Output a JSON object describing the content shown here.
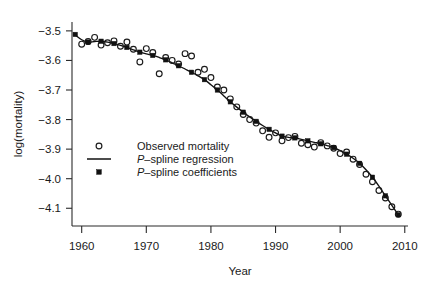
{
  "chart_data": {
    "type": "scatter",
    "title": "",
    "xlabel": "Year",
    "ylabel": "log(mortality)",
    "xlim": [
      1958.5,
      2010.5
    ],
    "ylim": [
      -4.16,
      -3.47
    ],
    "grid": false,
    "legend_position": "left-center",
    "x_ticks": [
      1960,
      1970,
      1980,
      1990,
      2000,
      2010
    ],
    "x_tick_labels": [
      "1960",
      "1970",
      "1980",
      "1990",
      "2000",
      "2010"
    ],
    "y_ticks": [
      -3.5,
      -3.6,
      -3.7,
      -3.8,
      -3.9,
      -4.0,
      -4.1
    ],
    "y_tick_labels": [
      "-3.5",
      "-3.6",
      "-3.7",
      "-3.8",
      "-3.9",
      "-4.0",
      "-4.1"
    ],
    "series": [
      {
        "name": "Observed mortality",
        "marker": "open-circle",
        "x": [
          1960,
          1961,
          1962,
          1963,
          1964,
          1965,
          1966,
          1967,
          1968,
          1969,
          1970,
          1971,
          1972,
          1973,
          1974,
          1975,
          1976,
          1977,
          1978,
          1979,
          1980,
          1981,
          1982,
          1983,
          1984,
          1985,
          1986,
          1987,
          1988,
          1989,
          1990,
          1991,
          1992,
          1993,
          1994,
          1995,
          1996,
          1997,
          1998,
          1999,
          2000,
          2001,
          2002,
          2003,
          2004,
          2005,
          2006,
          2007,
          2008,
          2009
        ],
        "y": [
          -3.545,
          -3.536,
          -3.522,
          -3.548,
          -3.54,
          -3.534,
          -3.552,
          -3.538,
          -3.562,
          -3.605,
          -3.56,
          -3.573,
          -3.645,
          -3.59,
          -3.6,
          -3.612,
          -3.577,
          -3.585,
          -3.64,
          -3.63,
          -3.658,
          -3.69,
          -3.7,
          -3.73,
          -3.757,
          -3.783,
          -3.8,
          -3.812,
          -3.838,
          -3.86,
          -3.845,
          -3.872,
          -3.861,
          -3.857,
          -3.88,
          -3.885,
          -3.893,
          -3.878,
          -3.889,
          -3.897,
          -3.915,
          -3.91,
          -3.934,
          -3.952,
          -3.985,
          -4.01,
          -4.04,
          -4.065,
          -4.095,
          -4.12
        ]
      },
      {
        "name": "P-spline coefficients",
        "marker": "filled-square",
        "x": [
          1959,
          1961,
          1963,
          1965,
          1967,
          1969,
          1971,
          1973,
          1975,
          1977,
          1979,
          1981,
          1983,
          1985,
          1987,
          1989,
          1991,
          1993,
          1995,
          1997,
          1999,
          2001,
          2003,
          2005,
          2007,
          2009
        ],
        "y": [
          -3.512,
          -3.538,
          -3.535,
          -3.543,
          -3.556,
          -3.572,
          -3.583,
          -3.598,
          -3.618,
          -3.64,
          -3.665,
          -3.7,
          -3.74,
          -3.775,
          -3.806,
          -3.833,
          -3.856,
          -3.862,
          -3.872,
          -3.882,
          -3.895,
          -3.917,
          -3.948,
          -3.995,
          -4.058,
          -4.122
        ]
      },
      {
        "name": "P-spline regression",
        "marker": "line",
        "x": [
          1959,
          1960,
          1961,
          1962,
          1963,
          1964,
          1965,
          1966,
          1967,
          1968,
          1969,
          1970,
          1971,
          1972,
          1973,
          1974,
          1975,
          1976,
          1977,
          1978,
          1979,
          1980,
          1981,
          1982,
          1983,
          1984,
          1985,
          1986,
          1987,
          1988,
          1989,
          1990,
          1991,
          1992,
          1993,
          1994,
          1995,
          1996,
          1997,
          1998,
          1999,
          2000,
          2001,
          2002,
          2003,
          2004,
          2005,
          2006,
          2007,
          2008,
          2009
        ],
        "y": [
          -3.514,
          -3.53,
          -3.538,
          -3.536,
          -3.535,
          -3.538,
          -3.543,
          -3.549,
          -3.556,
          -3.564,
          -3.572,
          -3.578,
          -3.583,
          -3.59,
          -3.598,
          -3.608,
          -3.618,
          -3.629,
          -3.64,
          -3.652,
          -3.665,
          -3.682,
          -3.7,
          -3.72,
          -3.74,
          -3.758,
          -3.775,
          -3.791,
          -3.806,
          -3.82,
          -3.833,
          -3.845,
          -3.856,
          -3.86,
          -3.862,
          -3.867,
          -3.872,
          -3.877,
          -3.882,
          -3.888,
          -3.895,
          -3.905,
          -3.917,
          -3.931,
          -3.948,
          -3.97,
          -3.995,
          -4.025,
          -4.058,
          -4.09,
          -4.122
        ]
      }
    ],
    "legend_entries": [
      {
        "label": "Observed mortality",
        "marker": "open-circle",
        "italic_prefix": ""
      },
      {
        "label": "-spline regression",
        "marker": "line",
        "italic_prefix": "P"
      },
      {
        "label": "-spline coefficients",
        "marker": "filled-square",
        "italic_prefix": "P"
      }
    ]
  },
  "colors": {
    "axis": "#2b2b2b",
    "line": "#111111",
    "marker": "#1b1b1b",
    "background": "#ffffff"
  }
}
